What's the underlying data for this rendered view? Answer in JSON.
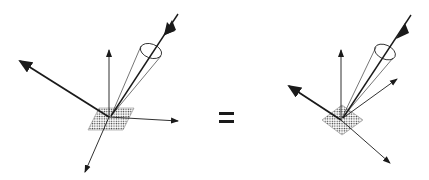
{
  "figure": {
    "operator": "=",
    "left": {
      "patch": "dotted parallelogram surface element",
      "arrows": [
        "incident beam (bold, downward)",
        "reflected (bold, upper-left)",
        "normal (up)",
        "tangent (right)",
        "transmitted (down-left)"
      ],
      "cone": "solid-angle cone around incident beam"
    },
    "right": {
      "patch": "dotted diamond surface element",
      "arrows": [
        "incident beam (bold, downward)",
        "reflected (bold, upper-left)",
        "normal (up)",
        "scattered (upper-right)",
        "transmitted (down-right)"
      ],
      "cone": "solid-angle cone around incident beam"
    },
    "colors": {
      "ink": "#1a1a1a",
      "background": "#ffffff"
    }
  }
}
